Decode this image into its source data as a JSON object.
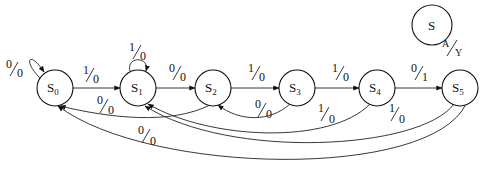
{
  "diagram": {
    "type": "state-machine",
    "legend": {
      "state": "S",
      "input": "A",
      "output": "Y"
    },
    "states": [
      {
        "id": "S0",
        "name": "S",
        "sub": "0"
      },
      {
        "id": "S1",
        "name": "S",
        "sub": "1"
      },
      {
        "id": "S2",
        "name": "S",
        "sub": "2"
      },
      {
        "id": "S3",
        "name": "S",
        "sub": "3"
      },
      {
        "id": "S4",
        "name": "S",
        "sub": "4"
      },
      {
        "id": "S5",
        "name": "S",
        "sub": "5"
      }
    ],
    "transitions": [
      {
        "from": "S0",
        "to": "S0",
        "in": "0",
        "out": "0"
      },
      {
        "from": "S0",
        "to": "S1",
        "in": "1",
        "out": "0"
      },
      {
        "from": "S1",
        "to": "S1",
        "in": "1",
        "out": "0"
      },
      {
        "from": "S1",
        "to": "S2",
        "in": "0",
        "out": "0"
      },
      {
        "from": "S2",
        "to": "S3",
        "in": "1",
        "out": "0"
      },
      {
        "from": "S3",
        "to": "S4",
        "in": "1",
        "out": "0"
      },
      {
        "from": "S4",
        "to": "S5",
        "in": "0",
        "out": "1"
      },
      {
        "from": "S2",
        "to": "S0",
        "in": "0",
        "out": "0"
      },
      {
        "from": "S3",
        "to": "S2",
        "in": "0",
        "out": "0"
      },
      {
        "from": "S4",
        "to": "S1",
        "in": "1",
        "out": "0"
      },
      {
        "from": "S5",
        "to": "S1",
        "in": "1",
        "out": "0"
      },
      {
        "from": "S5",
        "to": "S0",
        "in": "0",
        "out": "0"
      }
    ]
  }
}
